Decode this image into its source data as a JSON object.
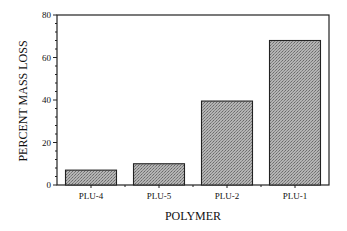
{
  "chart_data": {
    "type": "bar",
    "title": "",
    "xlabel": "POLYMER",
    "ylabel": "PERCENT MASS LOSS",
    "categories": [
      "PLU-4",
      "PLU-5",
      "PLU-2",
      "PLU-1"
    ],
    "values": [
      7,
      10,
      39.5,
      68
    ],
    "ylim": [
      0,
      80
    ],
    "yticks": [
      0,
      20,
      40,
      60,
      80
    ],
    "minor_tick_step": 4,
    "grid": false,
    "legend": null,
    "bar_fill": "#a8a8a8",
    "bar_pattern": "stippled gray"
  }
}
